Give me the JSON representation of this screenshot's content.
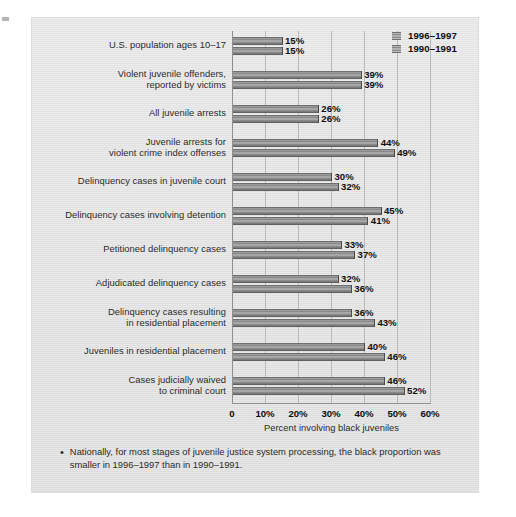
{
  "chart_data": {
    "type": "bar",
    "orientation": "horizontal",
    "title": "",
    "xlabel": "Percent involving black juveniles",
    "ylabel": "",
    "xlim": [
      0,
      60
    ],
    "grid": true,
    "legend_position": "top-right",
    "xticks": [
      "0",
      "10%",
      "20%",
      "30%",
      "40%",
      "50%",
      "60%"
    ],
    "xtick_values": [
      0,
      10,
      20,
      30,
      40,
      50,
      60
    ],
    "categories": [
      "U.S. population ages 10–17",
      "Violent juvenile offenders,\nreported by victims",
      "All juvenile arrests",
      "Juvenile arrests for\nviolent crime index offenses",
      "Delinquency cases in juvenile court",
      "Delinquency cases involving detention",
      "Petitioned delinquency cases",
      "Adjudicated delinquency cases",
      "Delinquency cases resulting\nin residential placement",
      "Juveniles in residential placement",
      "Cases judicially waived\nto criminal court"
    ],
    "series": [
      {
        "name": "1996–1997",
        "values": [
          15,
          39,
          26,
          44,
          30,
          45,
          33,
          32,
          36,
          40,
          46
        ],
        "labels": [
          "15%",
          "39%",
          "26%",
          "44%",
          "30%",
          "45%",
          "33%",
          "32%",
          "36%",
          "40%",
          "46%"
        ]
      },
      {
        "name": "1990–1991",
        "values": [
          15,
          39,
          26,
          49,
          32,
          41,
          37,
          36,
          43,
          46,
          52
        ],
        "labels": [
          "15%",
          "39%",
          "26%",
          "49%",
          "32%",
          "41%",
          "37%",
          "36%",
          "43%",
          "46%",
          "52%"
        ]
      }
    ]
  },
  "legend": {
    "items": [
      {
        "label": "1996–1997",
        "swatch": "banded-gray-swatch"
      },
      {
        "label": "1990–1991",
        "swatch": "banded-gray-swatch"
      }
    ]
  },
  "footnote": {
    "bullet": "•",
    "text": "Nationally, for most stages of juvenile justice system processing, the black proportion was smaller in 1996–1997 than in 1990–1991."
  },
  "colors": {
    "panel_background": "#e5e5e5",
    "bar_dark": "#6f6f6f",
    "bar_light": "#a6a6a6",
    "gridline": "#b9b9b9",
    "axis": "#8f8f8f",
    "text": "#2b2b2b",
    "value_text": "#0f0f0f"
  }
}
